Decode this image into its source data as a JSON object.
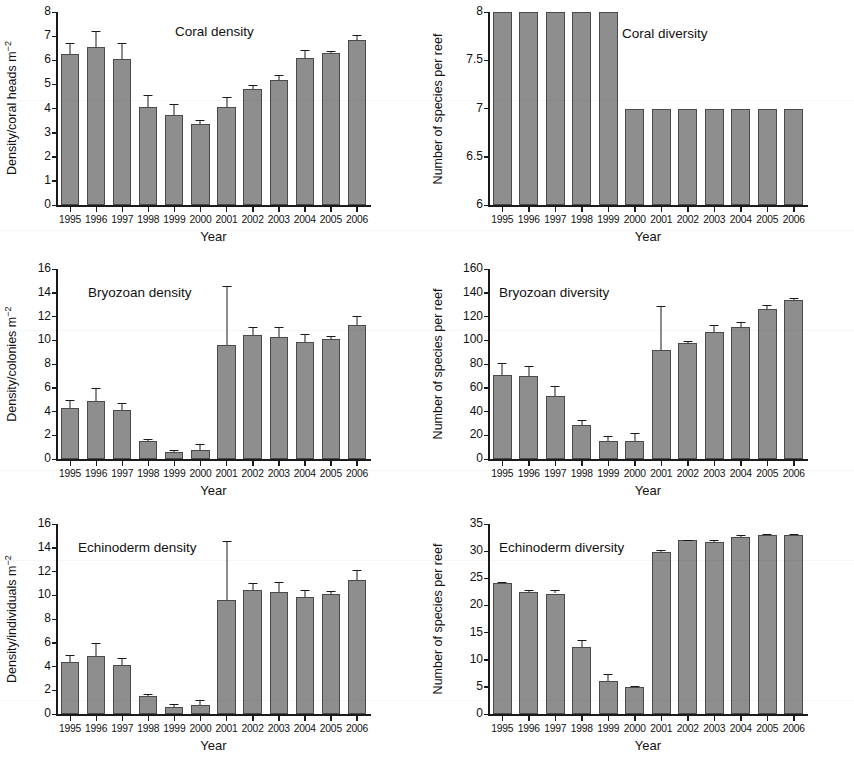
{
  "figure": {
    "width": 854,
    "height": 765,
    "bar_color": "#8e8e8e",
    "bar_edge_color": "#4a4a4a",
    "axis_color": "#1a1a1a",
    "background": "#ffffff",
    "xlabel_shared": "Year",
    "categories": [
      "1995",
      "1996",
      "1997",
      "1998",
      "1999",
      "2000",
      "2001",
      "2002",
      "2003",
      "2004",
      "2005",
      "2006"
    ]
  },
  "chart_data": [
    {
      "id": "coral-density",
      "type": "bar",
      "title": "Coral density",
      "xlabel": "Year",
      "ylabel": "Density/coral heads m⁻²",
      "ylim": [
        0,
        8
      ],
      "yticks": [
        0,
        1,
        2,
        3,
        4,
        5,
        6,
        7,
        8
      ],
      "yticklabels": [
        "0",
        "1",
        "2",
        "3",
        "4",
        "5",
        "6",
        "7",
        "8"
      ],
      "grid": false,
      "legend": "none",
      "categories": [
        "1995",
        "1996",
        "1997",
        "1998",
        "1999",
        "2000",
        "2001",
        "2002",
        "2003",
        "2004",
        "2005",
        "2006"
      ],
      "values": [
        6.25,
        6.55,
        6.05,
        4.05,
        3.75,
        3.35,
        4.05,
        4.8,
        5.2,
        6.1,
        6.3,
        6.85
      ],
      "errors": [
        0.45,
        0.65,
        0.65,
        0.5,
        0.45,
        0.18,
        0.42,
        0.18,
        0.17,
        0.33,
        0.1,
        0.2
      ]
    },
    {
      "id": "coral-diversity",
      "type": "bar",
      "title": "Coral diversity",
      "xlabel": "Year",
      "ylabel": "Number of species per reef",
      "ylim": [
        6,
        8
      ],
      "yticks": [
        6,
        6.5,
        7,
        7.5,
        8
      ],
      "yticklabels": [
        "6",
        "6.5",
        "7",
        "7.5",
        "8"
      ],
      "grid": false,
      "legend": "none",
      "categories": [
        "1995",
        "1996",
        "1997",
        "1998",
        "1999",
        "2000",
        "2001",
        "2002",
        "2003",
        "2004",
        "2005",
        "2006"
      ],
      "values": [
        8,
        8,
        8,
        8,
        8,
        7,
        7,
        7,
        7,
        7,
        7,
        7
      ],
      "errors": [
        0,
        0,
        0,
        0,
        0,
        0,
        0,
        0,
        0,
        0,
        0,
        0
      ]
    },
    {
      "id": "bryozoan-density",
      "type": "bar",
      "title": "Bryozoan density",
      "xlabel": "Year",
      "ylabel": "Density/colonies m⁻²",
      "ylim": [
        0,
        16
      ],
      "yticks": [
        0,
        2,
        4,
        6,
        8,
        10,
        12,
        14,
        16
      ],
      "yticklabels": [
        "0",
        "2",
        "4",
        "6",
        "8",
        "10",
        "12",
        "14",
        "16"
      ],
      "grid": false,
      "legend": "none",
      "categories": [
        "1995",
        "1996",
        "1997",
        "1998",
        "1999",
        "2000",
        "2001",
        "2002",
        "2003",
        "2004",
        "2005",
        "2006"
      ],
      "values": [
        4.3,
        4.85,
        4.1,
        1.5,
        0.62,
        0.78,
        9.6,
        10.45,
        10.25,
        9.85,
        10.1,
        11.3
      ],
      "errors": [
        0.7,
        1.1,
        0.65,
        0.2,
        0.12,
        0.45,
        5.0,
        0.65,
        0.85,
        0.65,
        0.28,
        0.75
      ]
    },
    {
      "id": "bryozoan-diversity",
      "type": "bar",
      "title": "Bryozoan diversity",
      "xlabel": "Year",
      "ylabel": "Number of species per reef",
      "ylim": [
        0,
        160
      ],
      "yticks": [
        0,
        20,
        40,
        60,
        80,
        100,
        120,
        140,
        160
      ],
      "yticklabels": [
        "0",
        "20",
        "40",
        "60",
        "80",
        "100",
        "120",
        "140",
        "160"
      ],
      "grid": false,
      "legend": "none",
      "categories": [
        "1995",
        "1996",
        "1997",
        "1998",
        "1999",
        "2000",
        "2001",
        "2002",
        "2003",
        "2004",
        "2005",
        "2006"
      ],
      "values": [
        71,
        70,
        53,
        29,
        15,
        15.5,
        92,
        98,
        107,
        111,
        126,
        133.5
      ],
      "errors": [
        9.5,
        8.5,
        8.5,
        3.5,
        4.0,
        6.5,
        37,
        1.5,
        6.0,
        4.5,
        4.0,
        2.5
      ]
    },
    {
      "id": "echinoderm-density",
      "type": "bar",
      "title": "Echinoderm density",
      "xlabel": "Year",
      "ylabel": "Density/individuals m⁻²",
      "ylim": [
        0,
        16
      ],
      "yticks": [
        0,
        2,
        4,
        6,
        8,
        10,
        12,
        14,
        16
      ],
      "yticklabels": [
        "0",
        "2",
        "4",
        "6",
        "8",
        "10",
        "12",
        "14",
        "16"
      ],
      "grid": false,
      "legend": "none",
      "categories": [
        "1995",
        "1996",
        "1997",
        "1998",
        "1999",
        "2000",
        "2001",
        "2002",
        "2003",
        "2004",
        "2005",
        "2006"
      ],
      "values": [
        4.35,
        4.9,
        4.15,
        1.55,
        0.62,
        0.78,
        9.6,
        10.45,
        10.25,
        9.85,
        10.1,
        11.25
      ],
      "errors": [
        0.6,
        1.1,
        0.55,
        0.15,
        0.2,
        0.4,
        5.0,
        0.55,
        0.85,
        0.6,
        0.3,
        0.85
      ]
    },
    {
      "id": "echinoderm-diversity",
      "type": "bar",
      "title": "Echinoderm diversity",
      "xlabel": "Year",
      "ylabel": "Number of species per reef",
      "ylim": [
        0,
        35
      ],
      "yticks": [
        0,
        5,
        10,
        15,
        20,
        25,
        30,
        35
      ],
      "yticklabels": [
        "0",
        "5",
        "10",
        "15",
        "20",
        "25",
        "30",
        "35"
      ],
      "grid": false,
      "legend": "none",
      "categories": [
        "1995",
        "1996",
        "1997",
        "1998",
        "1999",
        "2000",
        "2001",
        "2002",
        "2003",
        "2004",
        "2005",
        "2006"
      ],
      "values": [
        24.1,
        22.5,
        22.2,
        12.3,
        6.1,
        5.05,
        29.9,
        32.0,
        31.7,
        32.6,
        33.0,
        33.0
      ],
      "errors": [
        0.15,
        0.4,
        0.6,
        1.3,
        1.2,
        0.1,
        0.3,
        0.12,
        0.35,
        0.3,
        0.1,
        0.1
      ]
    }
  ]
}
